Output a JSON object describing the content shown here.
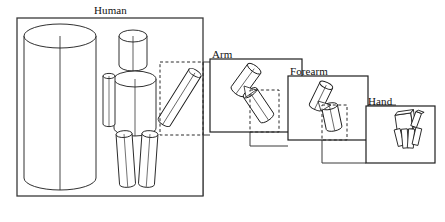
{
  "figure": {
    "title_visible": false,
    "type": "hierarchical-part-decomposition-diagram",
    "background_color": "#ffffff",
    "stroke_color": "#1a1a1a",
    "frame_stroke_color": "#3a3a3a",
    "dashed_stroke_color": "#2b2b2b"
  },
  "labels": {
    "human": "Human",
    "arm": "Arm",
    "forearm": "Forearm",
    "hand": "Hand"
  },
  "panels": [
    {
      "id": "human",
      "label": "Human",
      "box": {
        "x": 17,
        "y": 18,
        "w": 186,
        "h": 178
      },
      "description": "Full body built from cylinder primitives",
      "parts": [
        "large-background-cylinder",
        "head-cylinder",
        "torso-cylinder",
        "left-arm-cylinder",
        "right-arm-cylinder",
        "left-leg-cylinder",
        "right-leg-cylinder"
      ],
      "region_of_interest": {
        "x": 160,
        "y": 62,
        "w": 43,
        "h": 73,
        "style": "dashed"
      }
    },
    {
      "id": "arm",
      "label": "Arm",
      "box": {
        "x": 210,
        "y": 59,
        "w": 92,
        "h": 73
      },
      "description": "Upper arm and forearm cylinders joined at elbow",
      "parts": [
        "upper-arm-cylinder",
        "forearm-cylinder"
      ],
      "region_of_interest": {
        "x": 250,
        "y": 90,
        "w": 29,
        "h": 42,
        "style": "dashed"
      }
    },
    {
      "id": "forearm",
      "label": "Forearm",
      "box": {
        "x": 288,
        "y": 76,
        "w": 80,
        "h": 64
      },
      "description": "Forearm cylinder joined to hand block at wrist",
      "parts": [
        "forearm-cylinder",
        "hand-cylinder"
      ],
      "region_of_interest": {
        "x": 322,
        "y": 105,
        "w": 25,
        "h": 35,
        "style": "dashed"
      }
    },
    {
      "id": "hand",
      "label": "Hand",
      "box": {
        "x": 366,
        "y": 106,
        "w": 69,
        "h": 57
      },
      "description": "Hand with palm, thumb and four fingers",
      "parts": [
        "palm",
        "thumb",
        "finger-1",
        "finger-2",
        "finger-3",
        "finger-4"
      ],
      "region_of_interest": null
    }
  ],
  "connections": [
    {
      "from": "human",
      "to": "arm",
      "style": "dashed-then-solid",
      "note": "zoom link top"
    },
    {
      "from": "human",
      "to": "arm",
      "style": "solid",
      "note": "zoom link bottom"
    },
    {
      "from": "arm",
      "to": "forearm",
      "style": "dashed-then-solid",
      "note": "zoom link top"
    },
    {
      "from": "arm",
      "to": "forearm",
      "style": "solid",
      "note": "zoom link bottom"
    },
    {
      "from": "forearm",
      "to": "hand",
      "style": "dashed-then-solid",
      "note": "zoom link top"
    },
    {
      "from": "forearm",
      "to": "hand",
      "style": "solid",
      "note": "zoom link bottom"
    }
  ]
}
